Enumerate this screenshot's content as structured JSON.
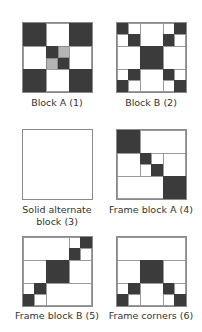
{
  "colors": {
    "dark": "#3b3b3b",
    "grey": "#b4b4b4",
    "light": "#ffffff",
    "outline": "#8a8a8a"
  },
  "blocks": [
    {
      "id": 1,
      "caption": "Block A (1)"
    },
    {
      "id": 2,
      "caption": "Block B (2)"
    },
    {
      "id": 3,
      "caption_line1": "Solid alternate",
      "caption_line2": "block (3)"
    },
    {
      "id": 4,
      "caption": "Frame block A (4)"
    },
    {
      "id": 5,
      "caption": "Frame block B (5)"
    },
    {
      "id": 6,
      "caption": "Frame corners (6)"
    }
  ]
}
